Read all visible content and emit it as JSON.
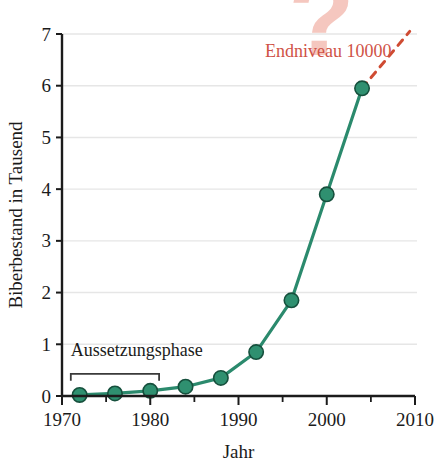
{
  "chart_data": {
    "type": "line",
    "title": "",
    "xlabel": "Jahr",
    "ylabel": "Biberbestand in Tausend",
    "xlim": [
      1970,
      2010
    ],
    "ylim": [
      0,
      7
    ],
    "grid": true,
    "legend": false,
    "x": [
      1972,
      1976,
      1980,
      1984,
      1988,
      1992,
      1996,
      2000,
      2004
    ],
    "values": [
      0.02,
      0.05,
      0.1,
      0.18,
      0.35,
      0.85,
      1.85,
      3.9,
      5.95
    ],
    "series": [
      {
        "name": "Biberbestand",
        "color": "#2b8a6d",
        "x": [
          1972,
          1976,
          1980,
          1984,
          1988,
          1992,
          1996,
          2000,
          2004
        ],
        "values": [
          0.02,
          0.05,
          0.1,
          0.18,
          0.35,
          0.85,
          1.85,
          3.9,
          5.95
        ]
      }
    ],
    "projection": {
      "name": "Extrapolation",
      "style": "dashed",
      "color": "#cf4b32",
      "x": [
        2004,
        2009.4
      ],
      "values": [
        5.95,
        7.05
      ]
    },
    "x_ticks": [
      1970,
      1980,
      1990,
      2000,
      2010
    ],
    "x_tick_labels": [
      "1970",
      "1980",
      "1990",
      "2000",
      "2010"
    ],
    "x_minor_ticks": [
      1975,
      1985,
      1995,
      2005
    ],
    "y_ticks": [
      0,
      1,
      2,
      3,
      4,
      5,
      6,
      7
    ],
    "y_tick_labels": [
      "0",
      "1",
      "2",
      "3",
      "4",
      "5",
      "6",
      "7"
    ],
    "annotations": [
      {
        "name": "endniveau-label",
        "text": "Endniveau 10000",
        "color": "#cf5246",
        "x": 1993.0,
        "y": 6.55
      },
      {
        "name": "question-mark-watermark",
        "text": "?",
        "color": "#f2b5aa",
        "x": 1999.4,
        "y": 6.6
      },
      {
        "name": "aussetzungsphase-label",
        "text": "Aussetzungsphase",
        "color": "#1b1b1b",
        "x": 1971.0,
        "y": 0.78
      }
    ],
    "brackets": [
      {
        "name": "aussetzungsphase-bracket",
        "label": "Aussetzungsphase",
        "x_start": 1971,
        "x_end": 1981,
        "y": 0.43
      }
    ]
  },
  "axes": {
    "y_axis_title": "Biberbestand in Tausend",
    "x_axis_title": "Jahr"
  },
  "colors": {
    "line": "#2b8a6d",
    "marker_fill": "#2f9070",
    "marker_stroke": "#16503d",
    "projection": "#cf4b32",
    "annotation_text": "#cf5246",
    "watermark": "#f2b5aa",
    "grid": "#e6e6e6",
    "axis": "#1b1b1b",
    "background": "#ffffff"
  }
}
